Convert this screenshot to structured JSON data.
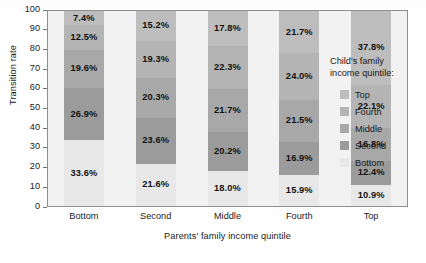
{
  "chart_data": {
    "type": "bar",
    "subtype": "stacked-bar-100",
    "title": "",
    "xlabel": "Parents' family income quintile",
    "ylabel": "Transition rate",
    "ylim": [
      0,
      100
    ],
    "yticks": [
      0,
      10,
      20,
      30,
      40,
      50,
      60,
      70,
      80,
      90,
      100
    ],
    "grid": false,
    "legend_position": "right",
    "legend_title": "Child's family income quintile:",
    "categories": [
      "Bottom",
      "Second",
      "Middle",
      "Fourth",
      "Top"
    ],
    "stack_order_bottom_to_top": [
      "Bottom",
      "Second",
      "Middle",
      "Fourth",
      "Top"
    ],
    "series": [
      {
        "name": "Bottom",
        "color": "#e8e8e8",
        "values": [
          33.6,
          21.6,
          18.0,
          15.9,
          10.9
        ],
        "labels": [
          "33.6%",
          "21.6%",
          "18.0%",
          "15.9%",
          "10.9%"
        ]
      },
      {
        "name": "Second",
        "color": "#9b9b9b",
        "values": [
          26.9,
          23.6,
          20.2,
          16.9,
          12.4
        ],
        "labels": [
          "26.9%",
          "23.6%",
          "20.2%",
          "16.9%",
          "12.4%"
        ]
      },
      {
        "name": "Middle",
        "color": "#a8a8a8",
        "values": [
          19.6,
          20.3,
          21.7,
          21.5,
          16.8
        ],
        "labels": [
          "19.6%",
          "20.3%",
          "21.7%",
          "21.5%",
          "16.8%"
        ]
      },
      {
        "name": "Fourth",
        "color": "#b4b4b4",
        "values": [
          12.5,
          19.3,
          22.3,
          24.0,
          22.1
        ],
        "labels": [
          "12.5%",
          "19.3%",
          "22.3%",
          "24.0%",
          "22.1%"
        ]
      },
      {
        "name": "Top",
        "color": "#bdbdbd",
        "values": [
          7.4,
          15.2,
          17.8,
          21.7,
          37.8
        ],
        "labels": [
          "7.4%",
          "15.2%",
          "17.8%",
          "21.7%",
          "37.8%"
        ]
      }
    ],
    "legend_entries": [
      {
        "label": "Top",
        "color": "#bdbdbd"
      },
      {
        "label": "Fourth",
        "color": "#b4b4b4"
      },
      {
        "label": "Middle",
        "color": "#a8a8a8"
      },
      {
        "label": "Second",
        "color": "#9b9b9b"
      },
      {
        "label": "Bottom",
        "color": "#e8e8e8"
      }
    ],
    "plot_background": "#f2f2f2",
    "frame_color": "#8d8f91"
  }
}
